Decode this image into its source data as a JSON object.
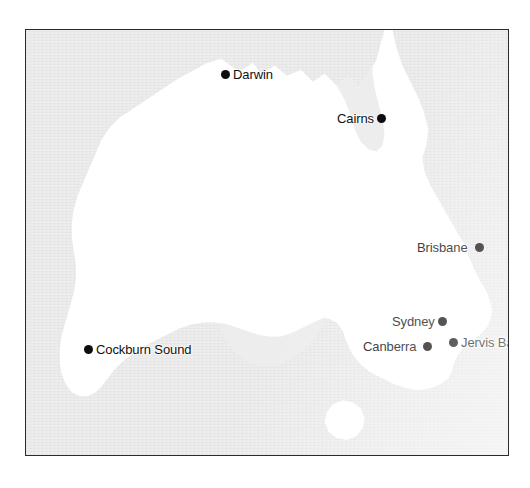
{
  "figure": {
    "frame": {
      "left": 25,
      "top": 29,
      "width": 484,
      "height": 427,
      "border_color": "#2b2b2b"
    },
    "colors": {
      "page_background": "#ffffff",
      "ocean_fill": "#ededed",
      "land_fill": "#ffffff",
      "marker_color": "#0d0d0d",
      "label_color": "#111111"
    }
  },
  "map": {
    "region_name": "Australia",
    "markers": [
      {
        "id": "darwin",
        "label": "Darwin",
        "label_side": "right",
        "dot_x": 220,
        "dot_y": 73,
        "wide_gap": false
      },
      {
        "id": "cairns",
        "label": "Cairns",
        "label_side": "left",
        "dot_x": 414,
        "dot_y": 117,
        "wide_gap": false
      },
      {
        "id": "brisbane",
        "label": "Brisbane",
        "label_side": "left",
        "dot_x": 494,
        "dot_y": 246,
        "wide_gap": true
      },
      {
        "id": "sydney",
        "label": "Sydney",
        "label_side": "left",
        "dot_x": 469,
        "dot_y": 320,
        "wide_gap": false
      },
      {
        "id": "canberra",
        "label": "Canberra",
        "label_side": "left",
        "dot_x": 440,
        "dot_y": 345,
        "wide_gap": true
      },
      {
        "id": "jervis-bay",
        "label": "Jervis Bay",
        "label_side": "right",
        "dot_x": 452,
        "dot_y": 341,
        "wide_gap": false
      },
      {
        "id": "cockburn-sound",
        "label": "Cockburn Sound",
        "label_side": "right",
        "dot_x": 87,
        "dot_y": 348,
        "wide_gap": false
      }
    ]
  }
}
